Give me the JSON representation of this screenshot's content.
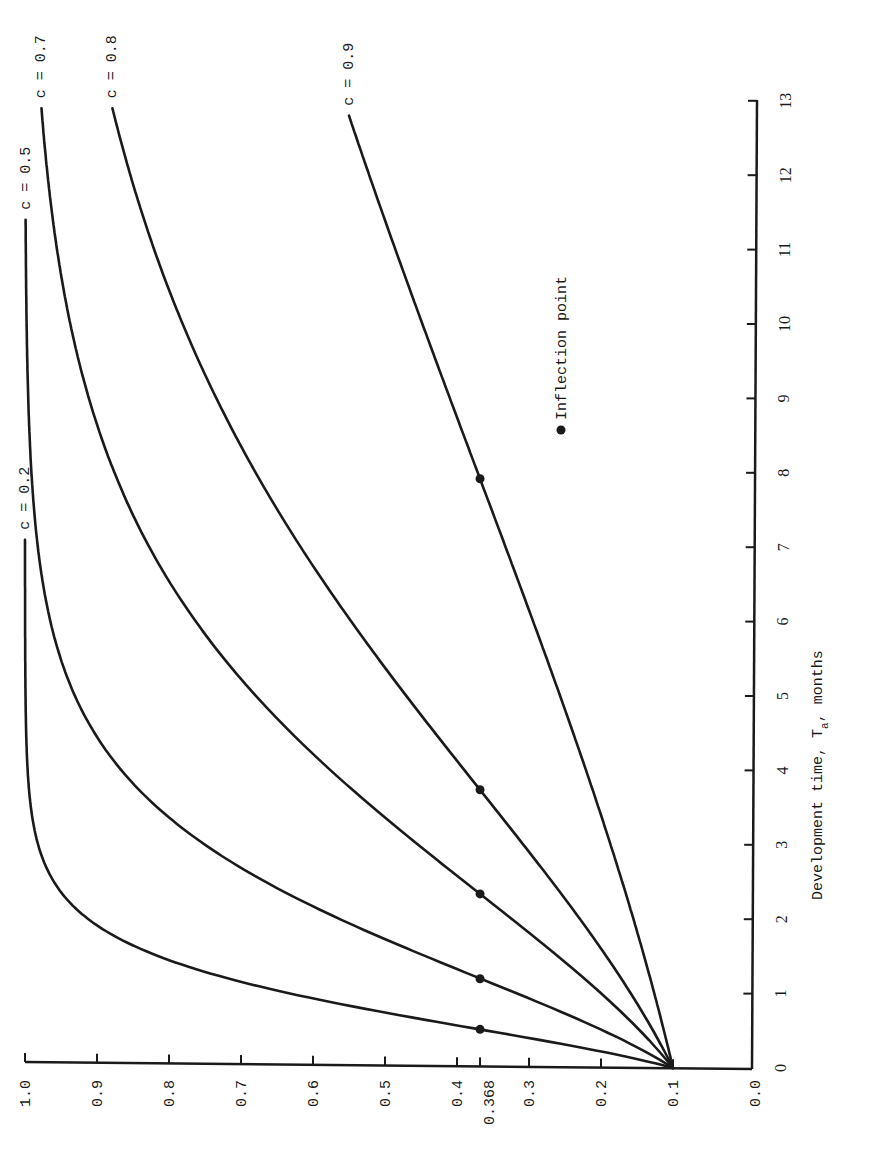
{
  "chart_data": {
    "type": "line",
    "orientation": "rotated 90deg counter-clockwise (page printed landscape)",
    "title": "",
    "xlabel": "Development time, T_a, months",
    "xlabel_main": "Development time, T",
    "xlabel_sub": "a",
    "xlabel_tail": ", months",
    "ylabel": "",
    "xlim": [
      0,
      13
    ],
    "ylim": [
      0.0,
      1.0
    ],
    "x_ticks": [
      0,
      1,
      2,
      3,
      4,
      5,
      6,
      7,
      8,
      9,
      10,
      11,
      12,
      13
    ],
    "y_ticks": [
      {
        "value": 1.0,
        "label": "1.0"
      },
      {
        "value": 0.9,
        "label": "0.9"
      },
      {
        "value": 0.8,
        "label": "0.8"
      },
      {
        "value": 0.7,
        "label": "0.7"
      },
      {
        "value": 0.6,
        "label": "0.6"
      },
      {
        "value": 0.5,
        "label": "0.5"
      },
      {
        "value": 0.4,
        "label": "0.4"
      },
      {
        "value": 0.368,
        "label": "0.368"
      },
      {
        "value": 0.3,
        "label": "0.3"
      },
      {
        "value": 0.2,
        "label": "0.2"
      },
      {
        "value": 0.1,
        "label": "0.1"
      },
      {
        "value": 0.0,
        "label": "0.0"
      }
    ],
    "grid": false,
    "model": "P(t) = 0.1^(c^t) (Gompertz; starts at 0.1, inflection at 0.368 = 1/e)",
    "series": [
      {
        "name": "c = 0.2",
        "c": 0.2,
        "t_end": 7.1,
        "inflection": {
          "x": 0.52,
          "y": 0.368
        },
        "x": [
          0,
          0.25,
          0.5,
          0.75,
          1,
          1.5,
          2,
          3,
          4,
          5,
          7.1
        ],
        "values": [
          0.1,
          0.21,
          0.36,
          0.51,
          0.63,
          0.81,
          0.91,
          0.98,
          1.0,
          1.0,
          1.0
        ]
      },
      {
        "name": "c = 0.5",
        "c": 0.5,
        "t_end": 11.4,
        "inflection": {
          "x": 1.2,
          "y": 0.368
        },
        "x": [
          0,
          0.5,
          1,
          1.5,
          2,
          3,
          4,
          5,
          6,
          8,
          11.4
        ],
        "values": [
          0.1,
          0.2,
          0.32,
          0.44,
          0.56,
          0.75,
          0.87,
          0.93,
          0.96,
          0.99,
          1.0
        ]
      },
      {
        "name": "c = 0.7",
        "c": 0.7,
        "t_end": 12.9,
        "inflection": {
          "x": 2.34,
          "y": 0.368
        },
        "x": [
          0,
          1,
          2,
          3,
          4,
          5,
          6,
          8,
          10,
          12.9
        ],
        "values": [
          0.1,
          0.2,
          0.32,
          0.45,
          0.58,
          0.68,
          0.76,
          0.88,
          0.94,
          0.98
        ]
      },
      {
        "name": "c = 0.8",
        "c": 0.8,
        "t_end": 12.9,
        "inflection": {
          "x": 3.74,
          "y": 0.368
        },
        "x": [
          0,
          1,
          2,
          3,
          4,
          5,
          6,
          8,
          10,
          12.9
        ],
        "values": [
          0.1,
          0.16,
          0.23,
          0.31,
          0.39,
          0.47,
          0.55,
          0.68,
          0.78,
          0.87
        ]
      },
      {
        "name": "c = 0.9",
        "c": 0.9,
        "t_end": 12.8,
        "inflection": {
          "x": 7.92,
          "y": 0.368
        },
        "x": [
          0,
          2,
          4,
          6,
          8,
          10,
          12.8
        ],
        "values": [
          0.1,
          0.16,
          0.22,
          0.3,
          0.37,
          0.45,
          0.53
        ]
      }
    ],
    "legend": {
      "marker": "filled circle",
      "label": "Inflection point"
    }
  },
  "labels": {
    "legend_text": "Inflection point",
    "curve_labels": [
      "c = 0.2",
      "c = 0.5",
      "c = 0.7",
      "c = 0.8",
      "c = 0.9"
    ]
  },
  "colors": {
    "ink": "#1a1a1a",
    "background": "#ffffff"
  }
}
